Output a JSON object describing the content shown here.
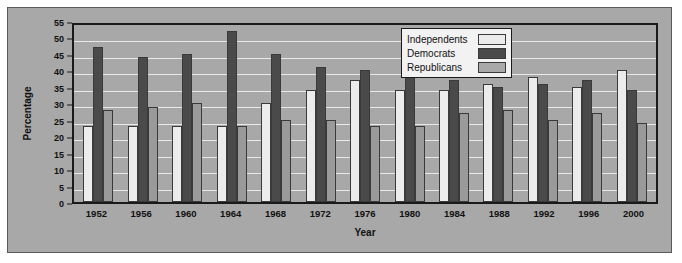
{
  "chart_data": {
    "type": "bar",
    "title": "",
    "xlabel": "Year",
    "ylabel": "Percentage",
    "ylim": [
      0,
      55
    ],
    "ytick_step": 5,
    "yticks": [
      0,
      5,
      10,
      15,
      20,
      25,
      30,
      35,
      40,
      45,
      50,
      55
    ],
    "grid": true,
    "legend_position": "top-right",
    "categories": [
      "1952",
      "1956",
      "1960",
      "1964",
      "1968",
      "1972",
      "1976",
      "1980",
      "1984",
      "1988",
      "1992",
      "1996",
      "2000"
    ],
    "series": [
      {
        "name": "Independents",
        "color": "#ececec",
        "values": [
          23,
          23,
          23,
          23,
          30,
          34,
          37,
          34,
          34,
          36,
          38,
          35,
          40
        ]
      },
      {
        "name": "Democrats",
        "color": "#4a4a4a",
        "values": [
          47,
          44,
          45,
          52,
          45,
          41,
          40,
          41,
          37,
          35,
          36,
          37,
          34
        ]
      },
      {
        "name": "Republicans",
        "color": "#9a9a9a",
        "values": [
          28,
          29,
          30,
          23,
          25,
          25,
          23,
          23,
          27,
          28,
          25,
          27,
          24
        ]
      }
    ]
  },
  "colors": {
    "figure_background": "#a8a8a8",
    "plot_background": "#a8a8a8",
    "gridline": "#e9e9e9",
    "axis": "#1a1a1a",
    "legend_background": "#f2f2f2",
    "page": "#ffffff"
  }
}
